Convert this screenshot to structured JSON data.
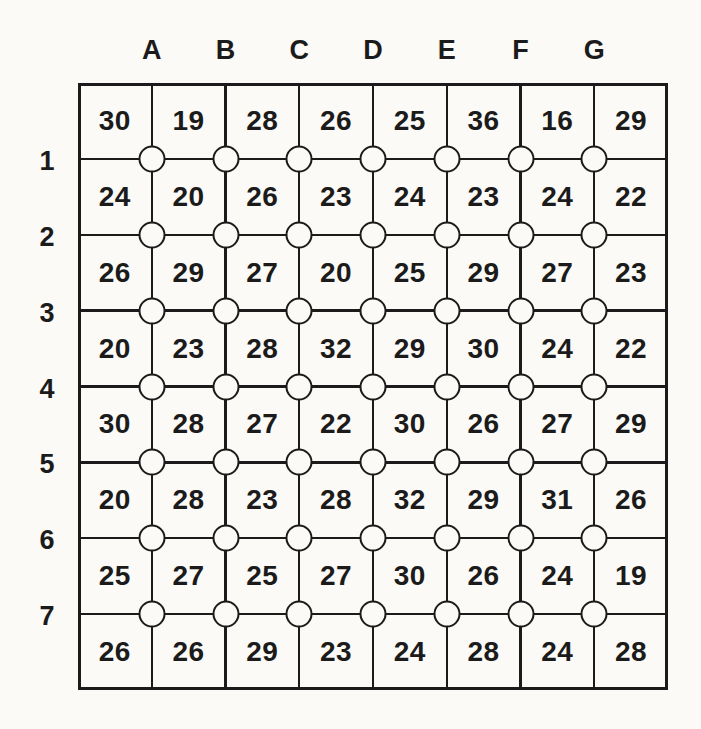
{
  "figure": {
    "column_labels": [
      "A",
      "B",
      "C",
      "D",
      "E",
      "F",
      "G"
    ],
    "row_labels": [
      "1",
      "2",
      "3",
      "4",
      "5",
      "6",
      "7"
    ],
    "cell_values": [
      [
        30,
        19,
        28,
        26,
        25,
        36,
        16,
        29
      ],
      [
        24,
        20,
        26,
        23,
        24,
        23,
        24,
        22
      ],
      [
        26,
        29,
        27,
        20,
        25,
        29,
        27,
        23
      ],
      [
        20,
        23,
        28,
        32,
        29,
        30,
        24,
        22
      ],
      [
        30,
        28,
        27,
        22,
        30,
        26,
        27,
        29
      ],
      [
        20,
        28,
        23,
        28,
        32,
        29,
        31,
        26
      ],
      [
        25,
        27,
        25,
        27,
        30,
        26,
        24,
        19
      ],
      [
        26,
        26,
        29,
        23,
        24,
        28,
        24,
        28
      ]
    ],
    "colors": {
      "ink": "#1b1b1b",
      "paper": "#fbfaf7"
    },
    "node_icon": "circle-node-icon"
  }
}
